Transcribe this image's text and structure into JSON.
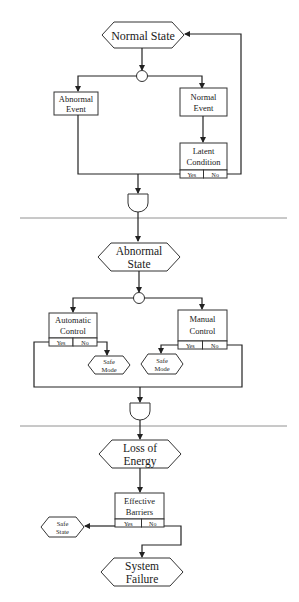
{
  "diagram": {
    "type": "flowchart",
    "colors": {
      "stroke": "#222222",
      "fill": "#ffffff",
      "separator": "#777777"
    },
    "sections": [
      {
        "name": "normal-operation",
        "nodes": {
          "normal_state": {
            "shape": "hexagon",
            "lines": [
              "Normal State"
            ]
          },
          "split1": {
            "shape": "circle"
          },
          "abnormal_event": {
            "shape": "box",
            "lines": [
              "Abnormal",
              "Event"
            ]
          },
          "normal_event": {
            "shape": "box",
            "lines": [
              "Normal",
              "Event"
            ]
          },
          "latent_condition": {
            "shape": "decision-box",
            "lines": [
              "Latent",
              "Condition"
            ],
            "yes": "Yes",
            "no": "No"
          },
          "and1": {
            "shape": "and-gate"
          }
        }
      },
      {
        "name": "abnormal-operation",
        "nodes": {
          "abnormal_state": {
            "shape": "hexagon",
            "lines": [
              "Abnormal",
              "State"
            ]
          },
          "split2": {
            "shape": "circle"
          },
          "automatic_control": {
            "shape": "decision-box",
            "lines": [
              "Automatic",
              "Control"
            ],
            "yes": "Yes",
            "no": "No"
          },
          "manual_control": {
            "shape": "decision-box",
            "lines": [
              "Manual",
              "Control"
            ],
            "yes": "Yes",
            "no": "No"
          },
          "safe_mode_left": {
            "shape": "hexagon",
            "lines": [
              "Safe",
              "Mode"
            ]
          },
          "safe_mode_right": {
            "shape": "hexagon",
            "lines": [
              "Safe",
              "Mode"
            ]
          },
          "and2": {
            "shape": "and-gate"
          }
        }
      },
      {
        "name": "failure",
        "nodes": {
          "loss_of_energy": {
            "shape": "hexagon",
            "lines": [
              "Loss of",
              "Energy"
            ]
          },
          "effective_barriers": {
            "shape": "decision-box",
            "lines": [
              "Effective",
              "Barriers"
            ],
            "yes": "Yes",
            "no": "No"
          },
          "safe_state": {
            "shape": "hexagon",
            "lines": [
              "Safe",
              "State"
            ]
          },
          "system_failure": {
            "shape": "hexagon",
            "lines": [
              "System",
              "Failure"
            ]
          }
        }
      }
    ],
    "edges": [
      [
        "normal_state",
        "split1"
      ],
      [
        "split1",
        "abnormal_event"
      ],
      [
        "split1",
        "normal_event"
      ],
      [
        "normal_event",
        "latent_condition"
      ],
      [
        "latent_condition.no",
        "normal_state"
      ],
      [
        "abnormal_event",
        "and1"
      ],
      [
        "latent_condition.yes",
        "and1"
      ],
      [
        "and1",
        "abnormal_state"
      ],
      [
        "abnormal_state",
        "split2"
      ],
      [
        "split2",
        "automatic_control"
      ],
      [
        "split2",
        "manual_control"
      ],
      [
        "automatic_control.no",
        "safe_mode_left"
      ],
      [
        "manual_control.yes",
        "safe_mode_right"
      ],
      [
        "automatic_control.yes",
        "and2"
      ],
      [
        "manual_control.no",
        "and2"
      ],
      [
        "and2",
        "loss_of_energy"
      ],
      [
        "loss_of_energy",
        "effective_barriers"
      ],
      [
        "effective_barriers.yes",
        "safe_state"
      ],
      [
        "effective_barriers.no",
        "system_failure"
      ]
    ]
  }
}
